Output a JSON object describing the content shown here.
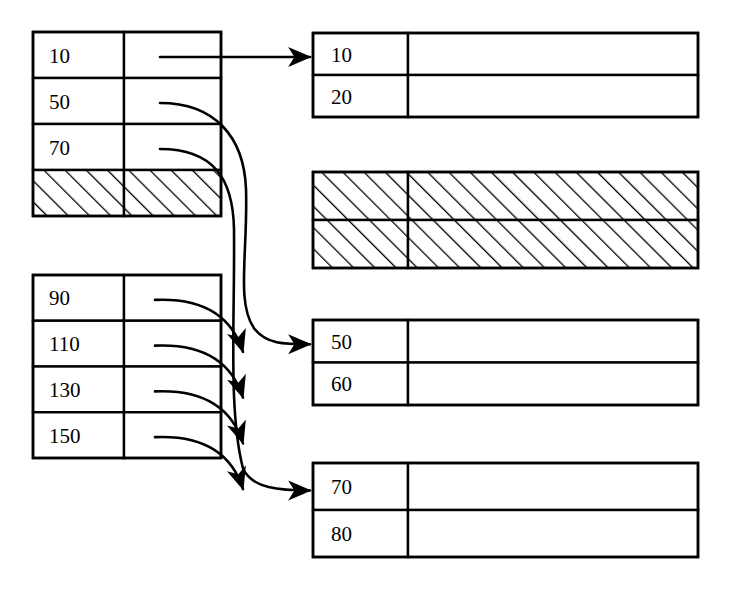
{
  "diagram": {
    "background_color": "#ffffff",
    "stroke_color": "#000000",
    "index_tables": [
      {
        "name": "upper-index-table",
        "x": 33,
        "y": 32,
        "width": 188,
        "height": 184,
        "divider_x": 124,
        "rows": [
          {
            "key": "10",
            "pointer": "straight",
            "target": "data-block-10"
          },
          {
            "key": "50",
            "pointer": "curve-long",
            "target": "data-block-50"
          },
          {
            "key": "70",
            "pointer": "curve-long",
            "target": "data-block-70"
          },
          {
            "key": "",
            "pointer": "none",
            "target": "",
            "hatched": true
          }
        ]
      },
      {
        "name": "lower-index-table",
        "x": 33,
        "y": 275,
        "width": 188,
        "height": 183,
        "divider_x": 124,
        "rows": [
          {
            "key": "90",
            "pointer": "curve-short",
            "target": ""
          },
          {
            "key": "110",
            "pointer": "curve-short",
            "target": ""
          },
          {
            "key": "130",
            "pointer": "curve-short",
            "target": ""
          },
          {
            "key": "150",
            "pointer": "curve-short",
            "target": ""
          }
        ]
      }
    ],
    "data_blocks": [
      {
        "name": "data-block-10",
        "x": 313,
        "y": 33,
        "width": 385,
        "height": 84,
        "divider_x": 408,
        "hatched": false,
        "has_incoming_arrow": true,
        "rows": [
          {
            "key": "10"
          },
          {
            "key": "20"
          }
        ]
      },
      {
        "name": "data-block-hatched",
        "x": 313,
        "y": 172,
        "width": 385,
        "height": 96,
        "divider_x": 408,
        "hatched": true,
        "has_incoming_arrow": false,
        "rows": [
          {
            "key": ""
          },
          {
            "key": ""
          }
        ]
      },
      {
        "name": "data-block-50",
        "x": 313,
        "y": 320,
        "width": 385,
        "height": 85,
        "divider_x": 408,
        "hatched": false,
        "has_incoming_arrow": true,
        "rows": [
          {
            "key": "50"
          },
          {
            "key": "60"
          }
        ]
      },
      {
        "name": "data-block-70",
        "x": 313,
        "y": 463,
        "width": 385,
        "height": 94,
        "divider_x": 408,
        "hatched": false,
        "has_incoming_arrow": true,
        "rows": [
          {
            "key": "70"
          },
          {
            "key": "80"
          }
        ]
      }
    ],
    "connectors": [
      {
        "name": "connector-10",
        "from": "10",
        "to": "data-block-10",
        "style": "straight-arrow"
      },
      {
        "name": "connector-50",
        "from": "50",
        "to": "data-block-50",
        "style": "curved-arrow"
      },
      {
        "name": "connector-70",
        "from": "70",
        "to": "data-block-70",
        "style": "curved-arrow"
      },
      {
        "name": "connector-90",
        "from": "90",
        "to": "",
        "style": "short-curved-arrow"
      },
      {
        "name": "connector-110",
        "from": "110",
        "to": "",
        "style": "short-curved-arrow"
      },
      {
        "name": "connector-130",
        "from": "130",
        "to": "",
        "style": "short-curved-arrow"
      },
      {
        "name": "connector-150",
        "from": "150",
        "to": "",
        "style": "short-curved-arrow"
      }
    ]
  }
}
